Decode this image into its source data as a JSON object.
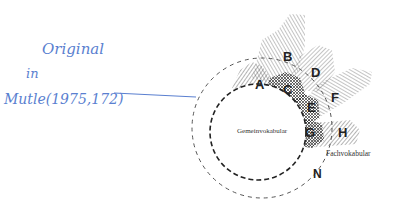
{
  "annotation": {
    "line1": "Original",
    "line2": "in",
    "line3": "Mutle(1975,172)",
    "color": "#5a7fd0"
  },
  "diagram": {
    "inner_circle_label": "Gemeinvokabular",
    "outer_label": "Fachvokabular",
    "outer_circle_label": "N",
    "regions": [
      {
        "id": "A",
        "label": "A"
      },
      {
        "id": "B",
        "label": "B"
      },
      {
        "id": "C",
        "label": "C"
      },
      {
        "id": "D",
        "label": "D"
      },
      {
        "id": "E",
        "label": "E"
      },
      {
        "id": "F",
        "label": "F"
      },
      {
        "id": "G",
        "label": "G"
      },
      {
        "id": "H",
        "label": "H"
      }
    ],
    "line_color": "#222222"
  }
}
